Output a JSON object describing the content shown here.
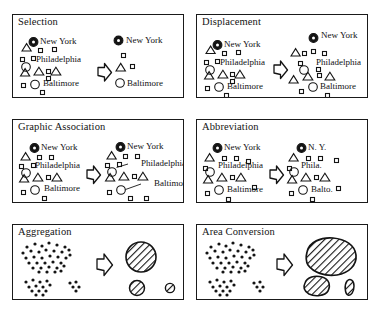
{
  "figure": {
    "panel_count": 6,
    "ink_color": "#141414",
    "background_color": "#ffffff"
  },
  "panels": [
    {
      "id": "selection",
      "title": "Selection",
      "arrow": "right-block-arrow",
      "before": {
        "caption": "dense original map",
        "city_labels": [
          "New York",
          "Philadelphia",
          "Baltimore"
        ],
        "symbols": {
          "filled_circle": 1,
          "open_circle": 2,
          "triangle": 5,
          "square": 9
        }
      },
      "after": {
        "caption": "selected features only",
        "city_labels": [
          "New York",
          "Baltimore"
        ],
        "symbols": {
          "filled_circle": 1,
          "open_circle": 1,
          "triangle": 1,
          "square": 2
        }
      }
    },
    {
      "id": "displacement",
      "title": "Displacement",
      "arrow": "right-block-arrow",
      "before": {
        "caption": "overlapping symbols",
        "city_labels": [
          "New York",
          "Philadelphia",
          "Baltimore"
        ],
        "symbols": {
          "filled_circle": 1,
          "open_circle": 2,
          "triangle": 5,
          "square": 9
        }
      },
      "after": {
        "caption": "symbols moved apart",
        "city_labels": [
          "New York",
          "Philadelphia",
          "Baltimore"
        ],
        "symbols": {
          "filled_circle": 1,
          "open_circle": 2,
          "triangle": 5,
          "square": 10
        }
      }
    },
    {
      "id": "graphic-association",
      "title": "Graphic Association",
      "arrow": "right-block-arrow",
      "before": {
        "caption": "labels placed loosely",
        "city_labels": [
          "New York",
          "Philadelphia",
          "Baltimore"
        ],
        "symbols": {
          "filled_circle": 1,
          "open_circle": 2,
          "triangle": 5,
          "square": 9
        }
      },
      "after": {
        "caption": "labels tied by leader lines",
        "city_labels": [
          "New York",
          "Philadelphia",
          "Baltimore"
        ],
        "leader_lines": 2,
        "symbols": {
          "filled_circle": 1,
          "open_circle": 2,
          "triangle": 5,
          "square": 10
        }
      }
    },
    {
      "id": "abbreviation",
      "title": "Abbreviation",
      "arrow": "right-block-arrow",
      "before": {
        "caption": "full place names",
        "city_labels": [
          "New York",
          "Philadelphia",
          "Baltimore"
        ],
        "symbols": {
          "filled_circle": 1,
          "open_circle": 2,
          "triangle": 5,
          "square": 10
        }
      },
      "after": {
        "caption": "shortened place names",
        "city_labels": [
          "N. Y.",
          "Phila.",
          "Balto."
        ],
        "symbols": {
          "filled_circle": 1,
          "open_circle": 2,
          "triangle": 5,
          "square": 11
        }
      }
    },
    {
      "id": "aggregation",
      "title": "Aggregation",
      "arrow": "right-block-arrow",
      "before": {
        "caption": "clusters of point dots",
        "clusters": 3,
        "dot_counts": [
          34,
          13,
          5
        ]
      },
      "after": {
        "caption": "hatched circles sized by count",
        "shapes": [
          "large hatched circle",
          "small hatched circle",
          "tiny hatched circle"
        ],
        "shape_count": 3
      }
    },
    {
      "id": "area-conversion",
      "title": "Area Conversion",
      "arrow": "right-block-arrow",
      "before": {
        "caption": "clusters of point dots",
        "clusters": 3,
        "dot_counts": [
          34,
          13,
          5
        ]
      },
      "after": {
        "caption": "hatched irregular polygons",
        "shapes": [
          "large hatched blob",
          "small hatched blob",
          "sliver hatched blob"
        ],
        "shape_count": 3
      }
    }
  ]
}
